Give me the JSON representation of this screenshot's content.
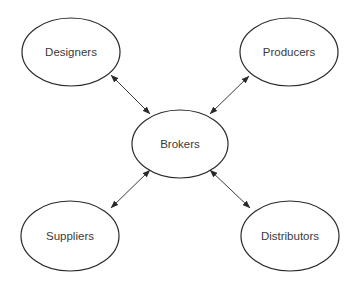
{
  "diagram": {
    "type": "hub-and-spoke",
    "width": 358,
    "height": 283,
    "colors": {
      "background": "#ffffff",
      "stroke": "#2a2a2a",
      "text": "#3a3a3a"
    },
    "nodes": [
      {
        "id": "designers",
        "label": "Designers",
        "cx": 71,
        "cy": 52,
        "rx": 49,
        "ry": 34
      },
      {
        "id": "producers",
        "label": "Producers",
        "cx": 289,
        "cy": 52,
        "rx": 49,
        "ry": 34
      },
      {
        "id": "brokers",
        "label": "Brokers",
        "cx": 180,
        "cy": 144,
        "rx": 48,
        "ry": 34
      },
      {
        "id": "suppliers",
        "label": "Suppliers",
        "cx": 70,
        "cy": 236,
        "rx": 49,
        "ry": 35
      },
      {
        "id": "distributors",
        "label": "Distributors",
        "cx": 290,
        "cy": 236,
        "rx": 49,
        "ry": 35
      }
    ],
    "edges": [
      {
        "from": "designers",
        "to": "brokers",
        "direction": "bidirectional",
        "x1": 111,
        "y1": 75,
        "x2": 150,
        "y2": 114
      },
      {
        "from": "producers",
        "to": "brokers",
        "direction": "bidirectional",
        "x1": 249,
        "y1": 76,
        "x2": 210,
        "y2": 114
      },
      {
        "from": "suppliers",
        "to": "brokers",
        "direction": "bidirectional",
        "x1": 111,
        "y1": 208,
        "x2": 150,
        "y2": 170
      },
      {
        "from": "distributors",
        "to": "brokers",
        "direction": "bidirectional",
        "x1": 250,
        "y1": 208,
        "x2": 210,
        "y2": 170
      }
    ]
  }
}
